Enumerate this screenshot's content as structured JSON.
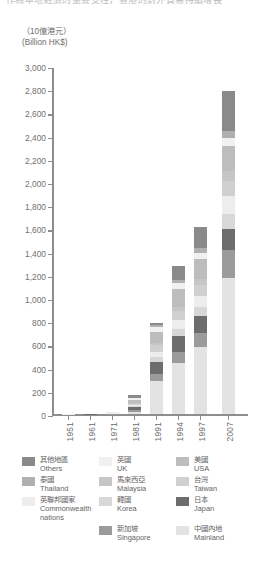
{
  "page": {
    "cropped_header_text": "作為本地經濟的重要支柱，香港的對外貿易持續增長"
  },
  "chart_data": {
    "type": "bar",
    "stacked": true,
    "title": "",
    "unit_label_cn": "（10億港元）",
    "unit_label_en": "(Billion HK$)",
    "xlabel": "",
    "ylabel": "",
    "ylim": [
      0,
      3000
    ],
    "ytick_step": 200,
    "grid": false,
    "legend_position": "bottom",
    "yticks": [
      "0",
      "200",
      "400",
      "600",
      "800",
      "1,000",
      "1,200",
      "1,400",
      "1,600",
      "1,800",
      "2,000",
      "2,200",
      "2,400",
      "2,600",
      "2,800",
      "3,000"
    ],
    "categories": [
      "1951",
      "1961",
      "1971",
      "1981",
      "1991",
      "1994",
      "1997",
      "2007"
    ],
    "totals": [
      2,
      6,
      22,
      165,
      790,
      1280,
      1620,
      2790
    ],
    "series": [
      {
        "name_cn": "中國內地",
        "name_en": "Mainland",
        "color": "#e3e3e3",
        "texture": false,
        "values": [
          0,
          0,
          0,
          22,
          290,
          440,
          580,
          1180
        ]
      },
      {
        "name_cn": "新加坡",
        "name_en": "Singapore",
        "color": "#9b9b9b",
        "texture": false,
        "values": [
          0,
          0,
          3,
          14,
          60,
          95,
          120,
          240
        ]
      },
      {
        "name_cn": "日本",
        "name_en": "Japan",
        "color": "#6d6d6d",
        "texture": true,
        "values": [
          0,
          1,
          4,
          30,
          105,
          140,
          150,
          175
        ]
      },
      {
        "name_cn": "韓國",
        "name_en": "Korea",
        "color": "#d8d8d8",
        "texture": false,
        "values": [
          0,
          0,
          1,
          7,
          40,
          65,
          80,
          135
        ]
      },
      {
        "name_cn": "英聯邦國家",
        "name_en": "Commonwealth nations",
        "color": "#ededed",
        "texture": false,
        "values": [
          0,
          1,
          2,
          12,
          45,
          70,
          90,
          150
        ]
      },
      {
        "name_cn": "台灣",
        "name_en": "Taiwan",
        "color": "#d0d0d0",
        "texture": false,
        "values": [
          0,
          0,
          1,
          9,
          55,
          80,
          95,
          130
        ]
      },
      {
        "name_cn": "馬來西亞",
        "name_en": "Malaysia",
        "color": "#c6c6c6",
        "texture": false,
        "values": [
          0,
          0,
          1,
          5,
          25,
          40,
          50,
          90
        ]
      },
      {
        "name_cn": "美國",
        "name_en": "USA",
        "color": "#bdbdbd",
        "texture": false,
        "values": [
          0,
          1,
          3,
          24,
          95,
          150,
          175,
          210
        ]
      },
      {
        "name_cn": "英國",
        "name_en": "UK",
        "color": "#f1f1f1",
        "texture": false,
        "values": [
          1,
          1,
          3,
          15,
          35,
          50,
          55,
          70
        ]
      },
      {
        "name_cn": "泰國",
        "name_en": "Thailand",
        "color": "#b0b0b0",
        "texture": false,
        "values": [
          0,
          1,
          1,
          6,
          20,
          30,
          40,
          60
        ]
      },
      {
        "name_cn": "其他地區",
        "name_en": "Others",
        "color": "#8a8a8a",
        "texture": true,
        "values": [
          1,
          1,
          3,
          21,
          20,
          120,
          185,
          350
        ]
      }
    ]
  },
  "legend": {
    "rows": [
      [
        {
          "color": "#8a8a8a",
          "texture": true,
          "cn": "其他地區",
          "en": "Others",
          "name": "others"
        },
        {
          "color": "#f1f1f1",
          "texture": false,
          "cn": "英國",
          "en": "UK",
          "name": "uk"
        },
        {
          "color": "#bdbdbd",
          "texture": false,
          "cn": "美國",
          "en": "USA",
          "name": "usa"
        }
      ],
      [
        {
          "color": "#b0b0b0",
          "texture": false,
          "cn": "泰國",
          "en": "Thailand",
          "name": "thailand"
        },
        {
          "color": "#c6c6c6",
          "texture": false,
          "cn": "馬來西亞",
          "en": "Malaysia",
          "name": "malaysia"
        },
        {
          "color": "#d0d0d0",
          "texture": false,
          "cn": "台灣",
          "en": "Taiwan",
          "name": "taiwan"
        }
      ],
      [
        {
          "color": "#ededed",
          "texture": false,
          "cn": "英聯邦國家",
          "en": "Commonwealth",
          "en2": "nations",
          "name": "commonwealth-nations"
        },
        {
          "color": "#d8d8d8",
          "texture": false,
          "cn": "韓國",
          "en": "Korea",
          "name": "korea"
        },
        {
          "color": "#6d6d6d",
          "texture": true,
          "cn": "日本",
          "en": "Japan",
          "name": "japan"
        }
      ],
      [
        {
          "color": "",
          "texture": false,
          "cn": "",
          "en": "",
          "name": "legend-empty"
        },
        {
          "color": "#9b9b9b",
          "texture": false,
          "cn": "新加坡",
          "en": "Singapore",
          "name": "singapore"
        },
        {
          "color": "#e3e3e3",
          "texture": false,
          "cn": "中國內地",
          "en": "Mainland",
          "name": "mainland"
        }
      ]
    ]
  }
}
